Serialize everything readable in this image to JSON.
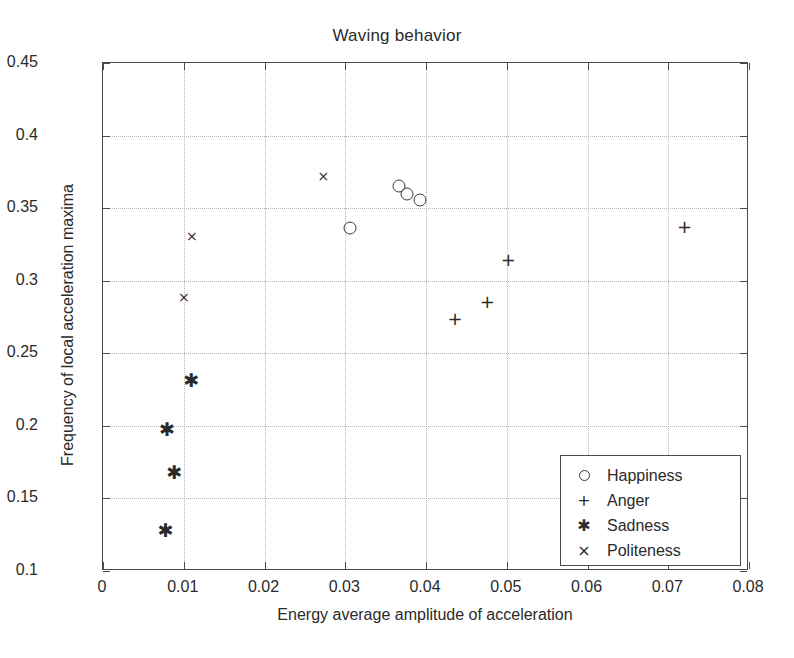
{
  "chart_data": {
    "type": "scatter",
    "title": "Waving behavior",
    "xlabel": "Energy average amplitude of acceleration",
    "ylabel": "Frequency of local acceleration maxima",
    "xlim": [
      0,
      0.08
    ],
    "ylim": [
      0.1,
      0.45
    ],
    "xticks": [
      0,
      0.01,
      0.02,
      0.03,
      0.04,
      0.05,
      0.06,
      0.07,
      0.08
    ],
    "xticklabels": [
      "0",
      "0.01",
      "0.02",
      "0.03",
      "0.04",
      "0.05",
      "0.06",
      "0.07",
      "0.08"
    ],
    "yticks": [
      0.1,
      0.15,
      0.2,
      0.25,
      0.3,
      0.35,
      0.4,
      0.45
    ],
    "yticklabels": [
      "0.1",
      "0.15",
      "0.2",
      "0.25",
      "0.3",
      "0.35",
      "0.4",
      "0.45"
    ],
    "grid": true,
    "grid_style": "dotted",
    "legend_position": "lower right",
    "marker_color": "#2a2a2a",
    "series": [
      {
        "name": "Happiness",
        "marker": "o",
        "marker_glyph": "○",
        "points": [
          {
            "x": 0.0306,
            "y": 0.3365
          },
          {
            "x": 0.0367,
            "y": 0.3655
          },
          {
            "x": 0.0377,
            "y": 0.36
          },
          {
            "x": 0.0393,
            "y": 0.3555
          }
        ]
      },
      {
        "name": "Anger",
        "marker": "+",
        "marker_glyph": "+",
        "points": [
          {
            "x": 0.0436,
            "y": 0.2745
          },
          {
            "x": 0.0476,
            "y": 0.286
          },
          {
            "x": 0.0502,
            "y": 0.315
          },
          {
            "x": 0.072,
            "y": 0.338
          }
        ]
      },
      {
        "name": "Sadness",
        "marker": "*",
        "marker_glyph": "✱",
        "points": [
          {
            "x": 0.0109,
            "y": 0.2315
          },
          {
            "x": 0.0079,
            "y": 0.198
          },
          {
            "x": 0.0088,
            "y": 0.1685
          },
          {
            "x": 0.0077,
            "y": 0.1285
          }
        ]
      },
      {
        "name": "Politeness",
        "marker": "x",
        "marker_glyph": "×",
        "points": [
          {
            "x": 0.011,
            "y": 0.3305
          },
          {
            "x": 0.01,
            "y": 0.2885
          },
          {
            "x": 0.0273,
            "y": 0.372
          }
        ]
      }
    ]
  }
}
